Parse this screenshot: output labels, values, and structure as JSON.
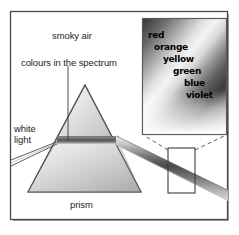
{
  "figure": {
    "kind": "physics-diagram",
    "background_color": "#ffffff",
    "frame": {
      "border_color": "#4a4a4a",
      "shadow_color": "#9a9a9a",
      "x": 10,
      "y": 11,
      "width": 218,
      "height": 209
    }
  },
  "labels": {
    "smoky_air": "smoky air",
    "colours_in_the_spectrum": "colours in the spectrum",
    "white": "white",
    "light": "light",
    "prism": "prism"
  },
  "spectrum_colours": [
    "red",
    "orange",
    "yellow",
    "green",
    "blue",
    "violet"
  ],
  "prism": {
    "apex": {
      "x": 85,
      "y": 85
    },
    "base_left": {
      "x": 28,
      "y": 192
    },
    "base_right": {
      "x": 141,
      "y": 192
    },
    "outline_color": "#555555",
    "fill_light": "#f2f2f2",
    "fill_dark": "#a8a8a8"
  },
  "incident_beam": {
    "name": "white-light-ray",
    "from": {
      "x": 11,
      "y": 158
    },
    "to": {
      "x": 58,
      "y": 140
    },
    "line_color": "#4f4f4f"
  },
  "refracted_beam": {
    "name": "dispersed-spectrum-beam",
    "entry": {
      "x": 58,
      "y": 140
    },
    "exit_face": {
      "x": 118,
      "y": 140
    },
    "end": {
      "x": 228,
      "y": 196
    },
    "band_dark": "#4c4c4c",
    "band_mid": "#8e8e8e",
    "band_light": "#e8e8e8"
  },
  "pointer_line": {
    "name": "colours-pointer",
    "x": 68,
    "y_top": 66,
    "y_bottom": 141,
    "color": "#3a3a3a"
  },
  "callout": {
    "sample_rect": {
      "x": 168,
      "y": 148,
      "width": 27,
      "height": 45
    },
    "panel": {
      "x": 142,
      "y": 18,
      "width": 85,
      "height": 117
    },
    "rect_color": "#3d3d3d",
    "panel_border_color": "#5a5a5a",
    "dash_color": "#4a4a4a",
    "gradient_dark": "#3c3c3c",
    "gradient_light": "#ffffff"
  }
}
